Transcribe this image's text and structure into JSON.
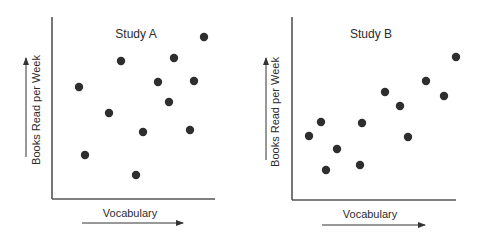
{
  "chart_data": [
    {
      "type": "scatter",
      "title": "Study A",
      "xlabel": "Vocabulary",
      "ylabel": "Books Read per Week",
      "grid": false,
      "legend": "none",
      "axis_ticks": "none",
      "xlim": [
        0,
        100
      ],
      "ylim": [
        0,
        100
      ],
      "points": [
        {
          "x": 16,
          "y": 62
        },
        {
          "x": 21,
          "y": 24
        },
        {
          "x": 35,
          "y": 47
        },
        {
          "x": 42,
          "y": 76
        },
        {
          "x": 51,
          "y": 13
        },
        {
          "x": 56,
          "y": 37
        },
        {
          "x": 65,
          "y": 64
        },
        {
          "x": 72,
          "y": 54
        },
        {
          "x": 75,
          "y": 78
        },
        {
          "x": 85,
          "y": 38
        },
        {
          "x": 87,
          "y": 65
        },
        {
          "x": 93,
          "y": 89
        }
      ],
      "pixel_layout": {
        "origin": [
          52,
          199
        ],
        "x_end": 215,
        "y_top": 17,
        "points_px": [
          [
            79,
            87
          ],
          [
            121,
            61
          ],
          [
            174,
            58
          ],
          [
            204,
            37
          ],
          [
            158,
            82
          ],
          [
            194,
            81
          ],
          [
            169,
            102
          ],
          [
            109,
            113
          ],
          [
            143,
            132
          ],
          [
            190,
            130
          ],
          [
            85,
            155
          ],
          [
            136,
            175
          ]
        ],
        "title_pos": [
          136,
          38
        ],
        "xlabel_pos": [
          130,
          217
        ],
        "x_arrow": [
          82,
          223,
          183
        ],
        "ylabel_pos": [
          40,
          110
        ],
        "y_arrow": [
          26,
          157,
          58
        ]
      }
    },
    {
      "type": "scatter",
      "title": "Study B",
      "xlabel": "Vocabulary",
      "ylabel": "Books Read per Week",
      "grid": false,
      "legend": "none",
      "axis_ticks": "none",
      "xlim": [
        0,
        100
      ],
      "ylim": [
        0,
        100
      ],
      "points": [
        {
          "x": 10,
          "y": 35
        },
        {
          "x": 17,
          "y": 42
        },
        {
          "x": 21,
          "y": 16
        },
        {
          "x": 28,
          "y": 28
        },
        {
          "x": 41,
          "y": 19
        },
        {
          "x": 43,
          "y": 42
        },
        {
          "x": 57,
          "y": 59
        },
        {
          "x": 66,
          "y": 51
        },
        {
          "x": 71,
          "y": 35
        },
        {
          "x": 82,
          "y": 65
        },
        {
          "x": 93,
          "y": 57
        },
        {
          "x": 100,
          "y": 78
        }
      ],
      "pixel_layout": {
        "origin": [
          292,
          200
        ],
        "x_end": 456,
        "y_top": 17,
        "points_px": [
          [
            309,
            136
          ],
          [
            321,
            122
          ],
          [
            337,
            149
          ],
          [
            326,
            170
          ],
          [
            362,
            123
          ],
          [
            360,
            165
          ],
          [
            385,
            92
          ],
          [
            400,
            106
          ],
          [
            408,
            137
          ],
          [
            426,
            81
          ],
          [
            444,
            96
          ],
          [
            456,
            57
          ]
        ],
        "title_pos": [
          371,
          38
        ],
        "xlabel_pos": [
          370,
          218
        ],
        "x_arrow": [
          322,
          225,
          425
        ],
        "ylabel_pos": [
          279,
          112
        ],
        "y_arrow": [
          266,
          160,
          58
        ]
      }
    }
  ]
}
